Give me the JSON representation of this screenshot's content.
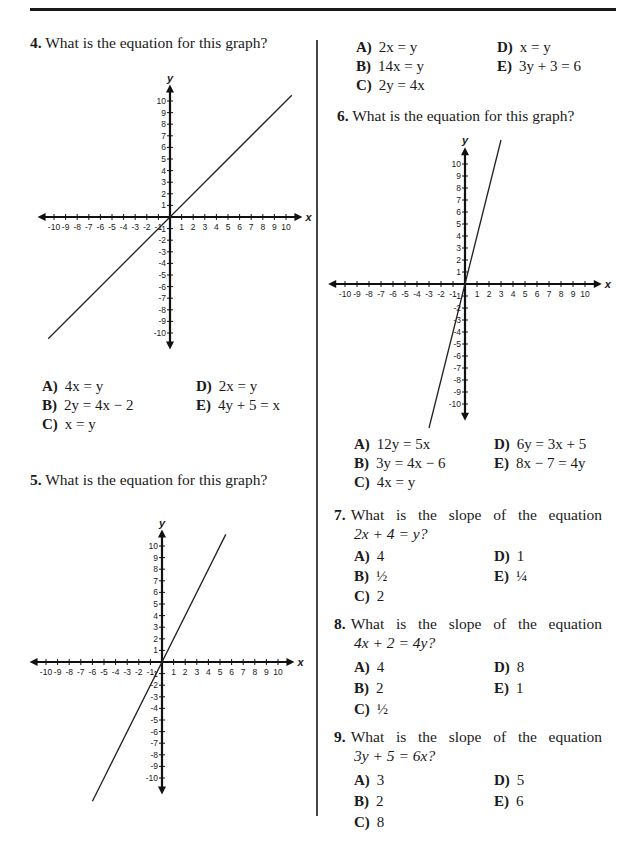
{
  "page": {
    "questions": [
      {
        "number": "4.",
        "stem": "What is the equation for this graph?",
        "graph": {
          "line": [
            [
              -10.5,
              -10.5
            ],
            [
              10.5,
              10.5
            ]
          ]
        },
        "options": [
          {
            "letter": "A)",
            "value": "4x = y"
          },
          {
            "letter": "B)",
            "value": "2y = 4x − 2"
          },
          {
            "letter": "C)",
            "value": "x = y"
          },
          {
            "letter": "D)",
            "value": "2x = y"
          },
          {
            "letter": "E)",
            "value": "4y + 5 = x"
          }
        ]
      },
      {
        "number": "5.",
        "stem": "What is the equation for this graph?",
        "graph": {
          "line": [
            [
              -6,
              -12
            ],
            [
              5.5,
              11
            ]
          ]
        },
        "options": [
          {
            "letter": "A)",
            "value": "2x = y"
          },
          {
            "letter": "B)",
            "value": "14x = y"
          },
          {
            "letter": "C)",
            "value": "2y = 4x"
          },
          {
            "letter": "D)",
            "value": "x = y"
          },
          {
            "letter": "E)",
            "value": "3y + 3 = 6"
          }
        ]
      },
      {
        "number": "6.",
        "stem": "What is the equation for this graph?",
        "graph": {
          "line": [
            [
              -3,
              -12
            ],
            [
              3,
              12
            ]
          ]
        },
        "options": [
          {
            "letter": "A)",
            "value": "12y = 5x"
          },
          {
            "letter": "B)",
            "value": "3y = 4x − 6"
          },
          {
            "letter": "C)",
            "value": "4x = y"
          },
          {
            "letter": "D)",
            "value": "6y = 3x + 5"
          },
          {
            "letter": "E)",
            "value": "8x − 7 = 4y"
          }
        ]
      },
      {
        "number": "7.",
        "stem_line1": "What is the slope of the equation",
        "stem_line2": "2x + 4 = y?",
        "options": [
          {
            "letter": "A)",
            "value": "4"
          },
          {
            "letter": "B)",
            "value": "½"
          },
          {
            "letter": "C)",
            "value": "2"
          },
          {
            "letter": "D)",
            "value": "1"
          },
          {
            "letter": "E)",
            "value": "¼"
          }
        ]
      },
      {
        "number": "8.",
        "stem_line1": "What is the slope of the equation",
        "stem_line2": "4x + 2 = 4y?",
        "options": [
          {
            "letter": "A)",
            "value": "4"
          },
          {
            "letter": "B)",
            "value": "2"
          },
          {
            "letter": "C)",
            "value": "½"
          },
          {
            "letter": "D)",
            "value": "8"
          },
          {
            "letter": "E)",
            "value": "1"
          }
        ]
      },
      {
        "number": "9.",
        "stem_line1": "What is the slope of the equation",
        "stem_line2": "3y + 5 = 6x?",
        "options": [
          {
            "letter": "A)",
            "value": "3"
          },
          {
            "letter": "B)",
            "value": "2"
          },
          {
            "letter": "C)",
            "value": "8"
          },
          {
            "letter": "D)",
            "value": "5"
          },
          {
            "letter": "E)",
            "value": "6"
          }
        ]
      }
    ],
    "axis": {
      "x_label": "x",
      "y_label": "y",
      "range": [
        -10,
        10
      ],
      "x_tick_labels": [
        "-10",
        "-9",
        "-8",
        "-7",
        "-6",
        "-5",
        "-4",
        "-3",
        "-2",
        "-1",
        "1",
        "2",
        "3",
        "4",
        "5",
        "6",
        "7",
        "8",
        "9",
        "10"
      ],
      "y_tick_labels": [
        "10",
        "9",
        "8",
        "7",
        "6",
        "5",
        "4",
        "3",
        "2",
        "1",
        "-1",
        "-2",
        "-3",
        "-4",
        "-5",
        "-6",
        "-7",
        "-8",
        "-9",
        "-10"
      ]
    }
  }
}
